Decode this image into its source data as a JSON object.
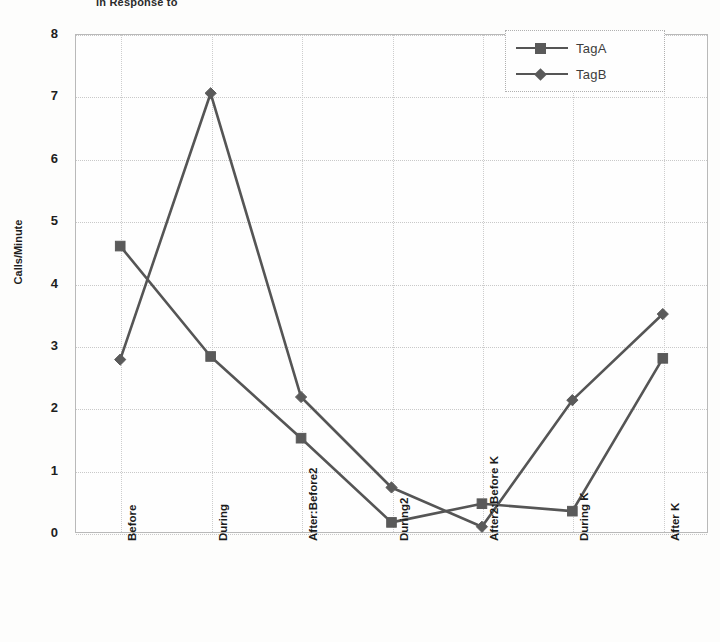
{
  "chart_data": {
    "type": "line",
    "title": "in Response to",
    "xlabel": "",
    "ylabel": "Calls/Minute",
    "ylim": [
      0,
      8
    ],
    "ytick_step": 1,
    "yticks": [
      "8",
      "7",
      "6",
      "5",
      "4",
      "3",
      "2",
      "1",
      "0"
    ],
    "grid": true,
    "legend_position": "top-right",
    "categories": [
      "Before",
      "During",
      "After:Before2",
      "During2",
      "After2:Before K",
      "During K",
      "After K"
    ],
    "series": [
      {
        "name": "TagA",
        "marker": "square",
        "color": "#555555",
        "values": [
          4.6,
          2.83,
          1.52,
          0.17,
          0.47,
          0.35,
          2.8
        ]
      },
      {
        "name": "TagB",
        "marker": "diamond",
        "color": "#555555",
        "values": [
          2.78,
          7.05,
          2.18,
          0.73,
          0.1,
          2.13,
          3.51
        ]
      }
    ]
  },
  "legend": {
    "entries": [
      {
        "label": "TagA",
        "marker": "square"
      },
      {
        "label": "TagB",
        "marker": "diamond"
      }
    ]
  },
  "colors": {
    "line": "#555555",
    "marker": "#5a5a5a",
    "grid": "#c9c9c9",
    "frame": "#b9b9b9",
    "text": "#1d1d1d",
    "background": "#fdfdfc"
  }
}
